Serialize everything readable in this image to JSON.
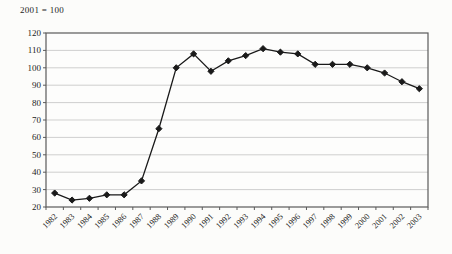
{
  "note": "2001 = 100",
  "chart_data": {
    "type": "line",
    "title": "",
    "note": "2001 = 100",
    "categories": [
      "1982",
      "1983",
      "1984",
      "1985",
      "1986",
      "1987",
      "1988",
      "1989",
      "1990",
      "1991",
      "1992",
      "1993",
      "1994",
      "1995",
      "1996",
      "1997",
      "1998",
      "1999",
      "2000",
      "2001",
      "2002",
      "2003"
    ],
    "series": [
      {
        "name": "index",
        "values": [
          28,
          24,
          25,
          27,
          27,
          35,
          65,
          100,
          108,
          98,
          104,
          107,
          111,
          109,
          108,
          102,
          102,
          102,
          100,
          97,
          92,
          88
        ]
      }
    ],
    "xlabel": "",
    "ylabel": "",
    "ylim": [
      20,
      120
    ],
    "ytick_step": 10,
    "grid": "horizontal",
    "legend": "none",
    "marker": "diamond",
    "colors": {
      "line": "#1a1a1a",
      "marker": "#1a1a1a",
      "grid": "#bcbcbc",
      "axis": "#5a5a5a",
      "text": "#1c1c1c",
      "plot_background": "#fdfdfc"
    }
  }
}
